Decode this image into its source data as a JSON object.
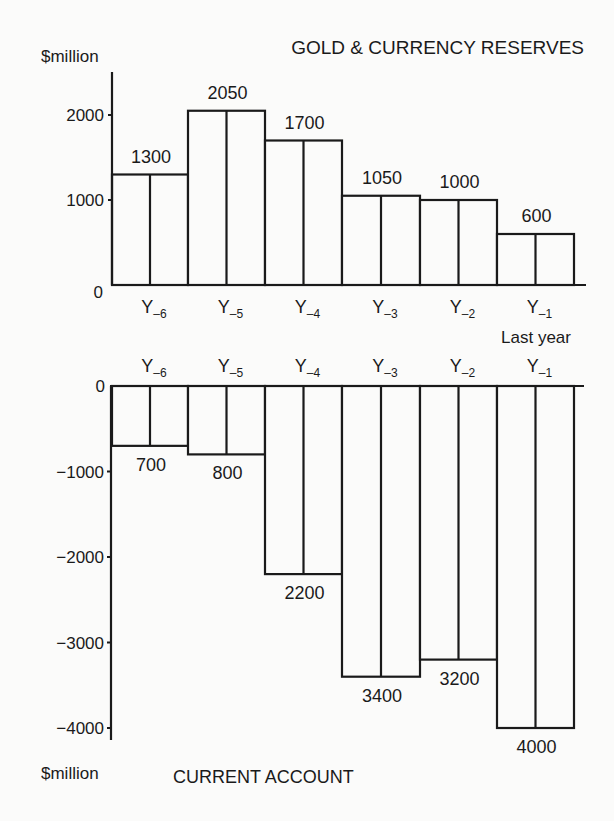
{
  "chart_data": [
    {
      "type": "bar",
      "title": "GOLD & CURRENCY RESERVES",
      "ylabel": "$million",
      "xlabel": "",
      "categories": [
        "Y-6",
        "Y-5",
        "Y-4",
        "Y-3",
        "Y-2",
        "Y-1"
      ],
      "category_labels": [
        {
          "base": "Y",
          "sub": "-6"
        },
        {
          "base": "Y",
          "sub": "-5"
        },
        {
          "base": "Y",
          "sub": "-4"
        },
        {
          "base": "Y",
          "sub": "-3"
        },
        {
          "base": "Y",
          "sub": "-2"
        },
        {
          "base": "Y",
          "sub": "-1"
        }
      ],
      "values": [
        1300,
        2050,
        1700,
        1050,
        1000,
        600
      ],
      "data_labels": [
        "1300",
        "2050",
        "1700",
        "1050",
        "1000",
        "600"
      ],
      "yticks": [
        0,
        1000,
        2000
      ],
      "ytick_labels": [
        "0",
        "1000",
        "2000"
      ],
      "ylim": [
        0,
        2500
      ],
      "annotation": "Last year",
      "grid": false
    },
    {
      "type": "bar",
      "title": "CURRENT ACCOUNT",
      "ylabel": "$million",
      "xlabel": "",
      "categories": [
        "Y-6",
        "Y-5",
        "Y-4",
        "Y-3",
        "Y-2",
        "Y-1"
      ],
      "category_labels": [
        {
          "base": "Y",
          "sub": "-6"
        },
        {
          "base": "Y",
          "sub": "-5"
        },
        {
          "base": "Y",
          "sub": "-4"
        },
        {
          "base": "Y",
          "sub": "-3"
        },
        {
          "base": "Y",
          "sub": "-2"
        },
        {
          "base": "Y",
          "sub": "-1"
        }
      ],
      "values": [
        -700,
        -800,
        -2200,
        -3400,
        -3200,
        -4000
      ],
      "data_labels": [
        "700",
        "800",
        "2200",
        "3400",
        "3200",
        "4000"
      ],
      "yticks": [
        0,
        -1000,
        -2000,
        -3000,
        -4000
      ],
      "ytick_labels": [
        "0",
        "−1000",
        "−2000",
        "−3000",
        "−4000"
      ],
      "ylim": [
        -4150,
        0
      ],
      "grid": false
    }
  ],
  "style": {
    "line_color": "#1a1a1a",
    "bar_fill": "#fbfbfa",
    "background": "#fbfbfa"
  }
}
